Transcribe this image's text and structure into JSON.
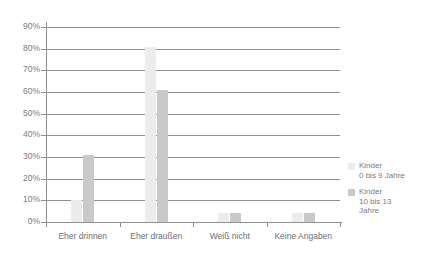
{
  "chart_data": {
    "type": "bar",
    "title": "",
    "xlabel": "",
    "ylabel": "",
    "ylim": [
      0,
      90
    ],
    "grid": true,
    "legend_position": "right",
    "categories": [
      "Eher drinnen",
      "Eher draußen",
      "Weiß nicht",
      "Keine Angaben"
    ],
    "ytick_labels": [
      "90%",
      "80%",
      "70%",
      "60%",
      "50%",
      "40%",
      "30%",
      "20%",
      "10%",
      "0%"
    ],
    "ytick_values": [
      90,
      80,
      70,
      60,
      50,
      40,
      30,
      20,
      10,
      0
    ],
    "series": [
      {
        "name": "Kinder\n0 bis 9 Jahre",
        "color": "#ececec",
        "values": [
          10,
          81,
          4,
          4
        ]
      },
      {
        "name": "Kinder\n10 bis 13\nJahre",
        "color": "#c9c9c9",
        "values": [
          31,
          61,
          4,
          4
        ]
      }
    ]
  },
  "legend": {
    "entries": [
      {
        "label": "Kinder\n0 bis 9 Jahre",
        "color": "#ececec"
      },
      {
        "label": "Kinder\n10 bis 13\nJahre",
        "color": "#c9c9c9"
      }
    ]
  }
}
